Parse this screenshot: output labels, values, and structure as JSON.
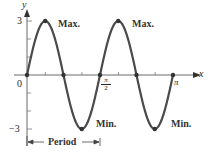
{
  "chart_data": {
    "type": "line",
    "title": "",
    "function": "y = 3 sin 4x",
    "xlabel": "x",
    "ylabel": "y",
    "xlim": [
      0,
      3.1416
    ],
    "ylim": [
      -3,
      3
    ],
    "grid": false,
    "legend": null,
    "x_tick_labels": [
      "0",
      "π/2",
      "π"
    ],
    "y_tick_labels": [
      "3",
      "0",
      "−3"
    ],
    "series": [
      {
        "name": "3 sin 4x",
        "x": [
          0,
          0.3927,
          0.7854,
          1.1781,
          1.5708,
          1.9635,
          2.3562,
          2.7489,
          3.1416
        ],
        "y": [
          0,
          3,
          0,
          -3,
          0,
          3,
          0,
          -3,
          0
        ]
      }
    ],
    "marked_points": [
      {
        "x": 0,
        "y": 0
      },
      {
        "x": 0.3927,
        "y": 3
      },
      {
        "x": 0.7854,
        "y": 0
      },
      {
        "x": 1.1781,
        "y": -3
      },
      {
        "x": 1.5708,
        "y": 0
      },
      {
        "x": 1.9635,
        "y": 3
      },
      {
        "x": 2.3562,
        "y": 0
      },
      {
        "x": 2.7489,
        "y": -3
      },
      {
        "x": 3.1416,
        "y": 0
      }
    ],
    "annotations": [
      {
        "text": "Max.",
        "x": 0.3927,
        "y": 3
      },
      {
        "text": "Max.",
        "x": 1.9635,
        "y": 3
      },
      {
        "text": "Min.",
        "x": 1.1781,
        "y": -3
      },
      {
        "text": "Min.",
        "x": 2.7489,
        "y": -3
      },
      {
        "text": "Period",
        "from_x": 0,
        "to_x": 1.5708,
        "type": "span-arrow"
      }
    ]
  },
  "labels": {
    "y_axis": "y",
    "x_axis": "x",
    "y_max": "3",
    "y_min": "−3",
    "origin": "0",
    "pi": "π",
    "half_pi_num": "π",
    "half_pi_den": "2",
    "max1": "Max.",
    "max2": "Max.",
    "min1": "Min.",
    "min2": "Min.",
    "period": "Period"
  },
  "colors": {
    "curve": "#4a4a4a",
    "axis": "#5a5a5a",
    "text": "#2a2a2a"
  }
}
